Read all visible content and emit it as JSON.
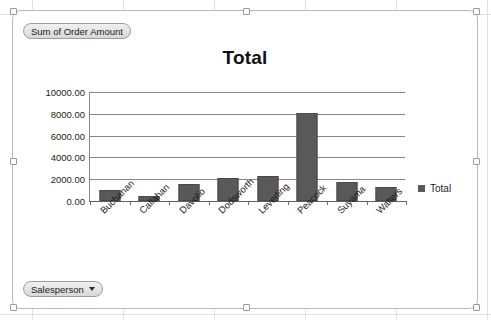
{
  "pivot": {
    "value_field_label": "Sum of Order Amount",
    "axis_field_label": "Salesperson",
    "dropdown_icon": "chevron-down-icon"
  },
  "legend": {
    "entries": [
      "Total"
    ],
    "position": "right",
    "swatch_color": "#595959"
  },
  "chart_data": {
    "type": "bar",
    "title": "Total",
    "xlabel": "",
    "ylabel": "",
    "categories": [
      "Buchanan",
      "Callahan",
      "Davolio",
      "Dodsworth",
      "Leverling",
      "Peacock",
      "Suyama",
      "Walters"
    ],
    "series": [
      {
        "name": "Total",
        "values": [
          1000,
          500,
          1550,
          2150,
          2300,
          8100,
          1750,
          1250
        ],
        "color": "#595959"
      }
    ],
    "ylim": [
      0,
      10000
    ],
    "ytick_values": [
      0,
      2000,
      4000,
      6000,
      8000,
      10000
    ],
    "ytick_labels": [
      "0.00",
      "2000.00",
      "4000.00",
      "6000.00",
      "8000.00",
      "10000.00"
    ],
    "grid": true,
    "legend_position": "right"
  }
}
